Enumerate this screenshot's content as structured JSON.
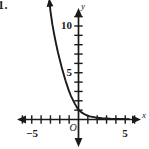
{
  "figure": {
    "problem_number": "1.",
    "background_color": "#ffffff",
    "ink_color": "#1a1a1a"
  },
  "labels": {
    "x_axis_name": "x",
    "y_axis_name": "y",
    "origin": "O"
  },
  "chart_data": {
    "type": "line",
    "title": "",
    "subtitle": "",
    "xlabel": "x",
    "ylabel": "y",
    "grid": false,
    "legend": null,
    "xlim": [
      -6.2,
      6.6
    ],
    "ylim": [
      -2.5,
      13.5
    ],
    "x_ticks": [
      -6,
      -5,
      -4,
      -3,
      -2,
      -1,
      0,
      1,
      2,
      3,
      4,
      5,
      6
    ],
    "y_ticks": [
      1,
      2,
      3,
      4,
      5,
      6,
      7,
      8,
      9,
      10,
      11,
      12
    ],
    "x_tick_labels": [
      {
        "value": -5,
        "text": "−5"
      },
      {
        "value": 5,
        "text": "5"
      }
    ],
    "y_tick_labels": [
      {
        "value": 5,
        "text": "5"
      },
      {
        "value": 10,
        "text": "10"
      }
    ],
    "axes_style": "arrows-both-ends",
    "annotations": [
      {
        "text": "O",
        "x": 0,
        "y": 0,
        "role": "origin-marker"
      },
      {
        "text": "x",
        "x": 6.5,
        "y": 0.3,
        "role": "x-axis-name"
      },
      {
        "text": "y",
        "x": 0.35,
        "y": 13.2,
        "role": "y-axis-name"
      }
    ],
    "series": [
      {
        "name": "exponential decay",
        "style": "solid",
        "arrow_start": true,
        "arrow_end": false,
        "asymptote": {
          "type": "horizontal",
          "y": 0
        },
        "points": [
          {
            "x": -3.1,
            "y": 12.6
          },
          {
            "x": -3.0,
            "y": 11.6
          },
          {
            "x": -2.8,
            "y": 10.2
          },
          {
            "x": -2.6,
            "y": 9.1
          },
          {
            "x": -2.4,
            "y": 8.1
          },
          {
            "x": -2.2,
            "y": 7.2
          },
          {
            "x": -2.0,
            "y": 6.4
          },
          {
            "x": -1.8,
            "y": 5.6
          },
          {
            "x": -1.6,
            "y": 4.9
          },
          {
            "x": -1.4,
            "y": 4.2
          },
          {
            "x": -1.2,
            "y": 3.6
          },
          {
            "x": -1.0,
            "y": 3.0
          },
          {
            "x": -0.8,
            "y": 2.5
          },
          {
            "x": -0.6,
            "y": 2.1
          },
          {
            "x": -0.4,
            "y": 1.7
          },
          {
            "x": -0.2,
            "y": 1.35
          },
          {
            "x": 0.0,
            "y": 1.05
          },
          {
            "x": 0.4,
            "y": 0.7
          },
          {
            "x": 0.8,
            "y": 0.48
          },
          {
            "x": 1.2,
            "y": 0.34
          },
          {
            "x": 1.8,
            "y": 0.22
          },
          {
            "x": 2.5,
            "y": 0.14
          },
          {
            "x": 3.4,
            "y": 0.09
          },
          {
            "x": 4.4,
            "y": 0.06
          },
          {
            "x": 5.4,
            "y": 0.04
          }
        ]
      }
    ]
  }
}
